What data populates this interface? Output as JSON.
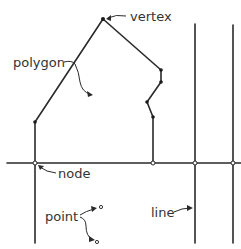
{
  "diagram": {
    "title": "",
    "labels": {
      "vertex": "vertex",
      "polygon": "polygon",
      "node": "node",
      "point": "point",
      "line": "line"
    },
    "colors": {
      "stroke": "#2a2a2a",
      "text": "#333333",
      "background": "#ffffff"
    }
  }
}
